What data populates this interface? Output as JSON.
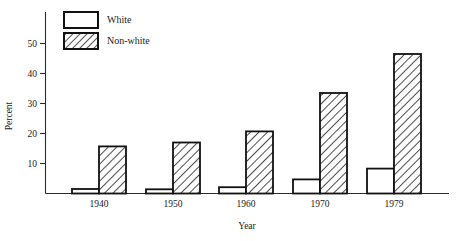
{
  "chart_data": {
    "type": "bar",
    "title": "",
    "xlabel": "Year",
    "ylabel": "Percent",
    "categories": [
      "1940",
      "1950",
      "1960",
      "1970",
      "1979"
    ],
    "series": [
      {
        "name": "White",
        "values": [
          1.5,
          1.4,
          2.1,
          4.7,
          8.3
        ],
        "fill": "none"
      },
      {
        "name": "Non-white",
        "values": [
          15.7,
          17.0,
          20.7,
          33.5,
          46.5
        ],
        "fill": "diagonal-hatch"
      }
    ],
    "ylim": [
      0,
      55
    ],
    "yticks": [
      10,
      20,
      30,
      40,
      50
    ],
    "ytick_labels": [
      "10",
      "20",
      "30",
      "40",
      "50"
    ],
    "grid": false,
    "legend_position": "top-left-inside"
  },
  "legend": {
    "entries": [
      {
        "label": "White",
        "swatch": "empty-box"
      },
      {
        "label": "Non-white",
        "swatch": "hatched-box"
      }
    ]
  },
  "axes": {
    "y_title": "Percent",
    "x_title": "Year"
  },
  "colors": {
    "ink": "#111111",
    "axis": "#2b2b2b",
    "background": "#ffffff"
  }
}
